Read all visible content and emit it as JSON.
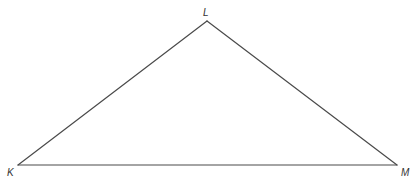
{
  "diagram": {
    "type": "triangle",
    "name": "Triangle KLM",
    "line_color": "#4a4a4a",
    "line_width": 1.2,
    "vertices": [
      {
        "id": "K",
        "label": "K",
        "x": 18,
        "y": 165,
        "label_x": 7,
        "label_y": 168
      },
      {
        "id": "L",
        "label": "L",
        "x": 207,
        "y": 21,
        "label_x": 203,
        "label_y": 8
      },
      {
        "id": "M",
        "label": "M",
        "x": 397,
        "y": 165,
        "label_x": 401,
        "label_y": 168
      }
    ],
    "sides": [
      {
        "from": "K",
        "to": "L",
        "name": "KL"
      },
      {
        "from": "L",
        "to": "M",
        "name": "LM"
      },
      {
        "from": "K",
        "to": "M",
        "name": "KM"
      }
    ]
  }
}
